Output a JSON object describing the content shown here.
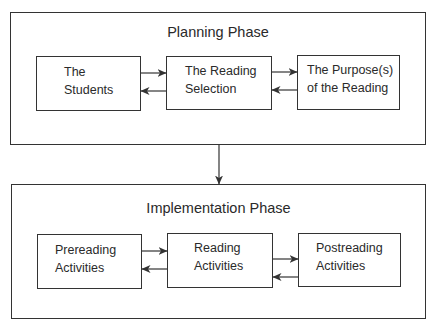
{
  "diagram": {
    "type": "flowchart",
    "flow": "Planning Phase -> Implementation Phase",
    "colors": {
      "line": "#333333",
      "text": "#2a2a2a",
      "background": "#ffffff"
    },
    "planning_phase": {
      "title": "Planning Phase",
      "nodes": [
        {
          "id": "students",
          "line1": "The",
          "line2": "Students"
        },
        {
          "id": "reading-selection",
          "line1": "The Reading",
          "line2": "Selection"
        },
        {
          "id": "purpose",
          "line1": "The Purpose(s)",
          "line2": "of the Reading"
        }
      ],
      "connections": [
        {
          "from": "students",
          "to": "reading-selection",
          "bidirectional": true
        },
        {
          "from": "reading-selection",
          "to": "purpose",
          "bidirectional": true
        }
      ]
    },
    "implementation_phase": {
      "title": "Implementation Phase",
      "nodes": [
        {
          "id": "prereading",
          "line1": "Prereading",
          "line2": "Activities"
        },
        {
          "id": "reading",
          "line1": "Reading",
          "line2": "Activities"
        },
        {
          "id": "postreading",
          "line1": "Postreading",
          "line2": "Activities"
        }
      ],
      "connections": [
        {
          "from": "prereading",
          "to": "reading",
          "bidirectional": true
        },
        {
          "from": "reading",
          "to": "postreading",
          "bidirectional": true
        }
      ]
    },
    "phase_connection": {
      "from": "planning_phase",
      "to": "implementation_phase",
      "direction": "down"
    }
  }
}
